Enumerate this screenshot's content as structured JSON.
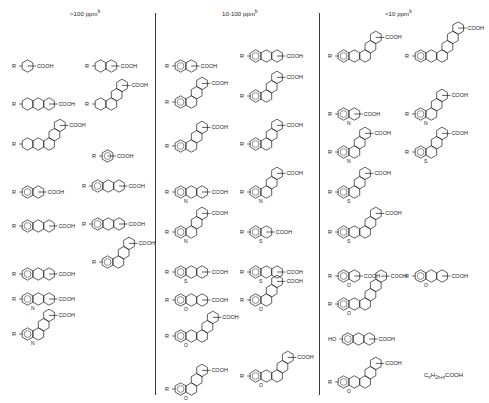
{
  "figure": {
    "columns": [
      {
        "id": "gt100",
        "header": ">100 ppm",
        "footnote": "b",
        "header_x": 70
      },
      {
        "id": "10to100",
        "header": "10-100 ppm",
        "footnote": "b",
        "header_x": 222
      },
      {
        "id": "lt10",
        "header": "<10 ppm",
        "footnote": "b",
        "header_x": 385
      }
    ],
    "dividers_x": [
      155,
      319
    ],
    "labels": {
      "acid": "COOH",
      "substituent": "R",
      "hydroxy": "HO",
      "nitrogen": "N",
      "sulfur": "S",
      "oxygen": "O",
      "hydrogen": "H"
    },
    "general_formula": {
      "base": "C",
      "n": "n",
      "h": "H",
      "sub": "2n+z",
      "tail": "COOH",
      "x": 424,
      "y": 372
    }
  },
  "structures": [
    {
      "col": 0,
      "x": 12,
      "y": 52,
      "rings": 1,
      "desc": "cyclohexane carboxylic acid"
    },
    {
      "col": 0,
      "x": 85,
      "y": 52,
      "rings": 2,
      "desc": "decalin carboxylic acid"
    },
    {
      "col": 0,
      "x": 12,
      "y": 90,
      "rings": 3,
      "desc": "perhydrophenanthrene carboxylic acid"
    },
    {
      "col": 0,
      "x": 85,
      "y": 90,
      "rings": 4,
      "desc": "steroid-type carboxylic acid"
    },
    {
      "col": 0,
      "x": 12,
      "y": 130,
      "rings": 5,
      "desc": "pentacyclic carboxylic acid"
    },
    {
      "col": 0,
      "x": 92,
      "y": 142,
      "rings": 1,
      "aromatic": true,
      "desc": "benzoic acid"
    },
    {
      "col": 0,
      "x": 12,
      "y": 178,
      "rings": 2,
      "aromatic": true,
      "desc": "tetralin carboxylic acid"
    },
    {
      "col": 0,
      "x": 82,
      "y": 172,
      "rings": 3,
      "aromatic": true,
      "desc": "hexahydrophenanthrene carboxylic acid"
    },
    {
      "col": 0,
      "x": 12,
      "y": 212,
      "rings": 3,
      "aromatic": true,
      "desc": "acenaphthene-type carboxylic acid"
    },
    {
      "col": 0,
      "x": 82,
      "y": 210,
      "rings": 3,
      "aromatic": true,
      "desc": "octahydrophenanthrene carboxylic acid"
    },
    {
      "col": 0,
      "x": 12,
      "y": 260,
      "rings": 3,
      "aromatic": true,
      "desc": "hexahydrofluorene carboxylic acid"
    },
    {
      "col": 0,
      "x": 92,
      "y": 248,
      "rings": 4,
      "aromatic": true,
      "desc": "hexahydropyrene carboxylic acid"
    },
    {
      "col": 0,
      "x": 12,
      "y": 285,
      "rings": 3,
      "aromatic": true,
      "hetero": "N",
      "desc": "carbazole carboxylic acid"
    },
    {
      "col": 0,
      "x": 12,
      "y": 320,
      "rings": 4,
      "aromatic": true,
      "hetero": "N",
      "desc": "benzacridine carboxylic acid"
    },
    {
      "col": 1,
      "x": 165,
      "y": 52,
      "rings": 2,
      "aromatic": true,
      "desc": "naphthoic acid"
    },
    {
      "col": 1,
      "x": 240,
      "y": 42,
      "rings": 3,
      "aromatic": true,
      "desc": "phenanthrene carboxylic acid"
    },
    {
      "col": 1,
      "x": 165,
      "y": 88,
      "rings": 4,
      "aromatic": true,
      "desc": "cyclopenta[a]phenanthrene carboxylic acid"
    },
    {
      "col": 1,
      "x": 240,
      "y": 82,
      "rings": 4,
      "aromatic": true,
      "desc": "pyrene carboxylic acid"
    },
    {
      "col": 1,
      "x": 165,
      "y": 132,
      "rings": 4,
      "aromatic": true,
      "desc": "chrysene carboxylic acid"
    },
    {
      "col": 1,
      "x": 240,
      "y": 130,
      "rings": 4,
      "aromatic": true,
      "desc": "benzofluorene carboxylic acid"
    },
    {
      "col": 1,
      "x": 165,
      "y": 178,
      "rings": 3,
      "aromatic": true,
      "hetero": "N",
      "desc": "acridine carboxylic acid"
    },
    {
      "col": 1,
      "x": 240,
      "y": 178,
      "rings": 4,
      "aromatic": true,
      "hetero": "N",
      "desc": "benzocarbazole carboxylic acid"
    },
    {
      "col": 1,
      "x": 165,
      "y": 218,
      "rings": 4,
      "aromatic": true,
      "hetero": "N",
      "desc": "benzocarbazole carboxylic acid isomer"
    },
    {
      "col": 1,
      "x": 240,
      "y": 218,
      "rings": 2,
      "aromatic": true,
      "hetero": "S",
      "desc": "benzothiophene carboxylic acid"
    },
    {
      "col": 1,
      "x": 165,
      "y": 258,
      "rings": 3,
      "aromatic": true,
      "hetero": "S",
      "desc": "dibenzothiophene carboxylic acid"
    },
    {
      "col": 1,
      "x": 240,
      "y": 258,
      "rings": 3,
      "aromatic": true,
      "hetero": "S",
      "desc": "dibenzothiophene carboxylic acid isomer"
    },
    {
      "col": 1,
      "x": 165,
      "y": 286,
      "rings": 3,
      "aromatic": true,
      "hetero": "O",
      "desc": "dibenzofuran carboxylic acid"
    },
    {
      "col": 1,
      "x": 240,
      "y": 286,
      "rings": 4,
      "aromatic": true,
      "hetero": "O",
      "desc": "benzonaphthofuran carboxylic acid"
    },
    {
      "col": 1,
      "x": 165,
      "y": 322,
      "rings": 5,
      "aromatic": true,
      "hetero": "O",
      "desc": "dinaphthofuran carboxylic acid"
    },
    {
      "col": 1,
      "x": 165,
      "y": 375,
      "rings": 4,
      "aromatic": true,
      "hetero": "O",
      "desc": "benzonaphthofuran carboxylic acid isomer"
    },
    {
      "col": 1,
      "x": 240,
      "y": 362,
      "rings": 5,
      "aromatic": true,
      "hetero": "O",
      "desc": "fluorenone-fused carboxylic acid"
    },
    {
      "col": 2,
      "x": 328,
      "y": 42,
      "rings": 5,
      "aromatic": true,
      "desc": "picene carboxylic acid"
    },
    {
      "col": 2,
      "x": 405,
      "y": 42,
      "rings": 6,
      "aromatic": true,
      "desc": "benzopyrene-type carboxylic acid"
    },
    {
      "col": 2,
      "x": 328,
      "y": 100,
      "rings": 2,
      "aromatic": true,
      "hetero": "N",
      "desc": "quinoline carboxylic acid"
    },
    {
      "col": 2,
      "x": 405,
      "y": 100,
      "rings": 4,
      "aromatic": true,
      "hetero": "N",
      "desc": "benzacridine carboxylic acid"
    },
    {
      "col": 2,
      "x": 328,
      "y": 138,
      "rings": 4,
      "aromatic": true,
      "hetero": "N",
      "desc": "dihydrophenazine carboxylic acid"
    },
    {
      "col": 2,
      "x": 405,
      "y": 138,
      "rings": 4,
      "aromatic": true,
      "hetero": "S",
      "desc": "benzonaphthothiophene carboxylic acid"
    },
    {
      "col": 2,
      "x": 328,
      "y": 178,
      "rings": 4,
      "aromatic": true,
      "hetero": "S",
      "desc": "naphthobenzothiophene carboxylic acid"
    },
    {
      "col": 2,
      "x": 328,
      "y": 218,
      "rings": 5,
      "aromatic": true,
      "hetero": "S",
      "desc": "dinaphthothiophene carboxylic acid"
    },
    {
      "col": 2,
      "x": 328,
      "y": 262,
      "rings": 2,
      "aromatic": true,
      "hetero": "O",
      "desc": "benzofuran carboxylic acid"
    },
    {
      "col": 2,
      "x": 405,
      "y": 262,
      "rings": 3,
      "aromatic": true,
      "hetero": "O",
      "desc": "dibenzofuran carboxylic acid"
    },
    {
      "col": 2,
      "x": 328,
      "y": 290,
      "rings": 6,
      "aromatic": true,
      "hetero": "O",
      "desc": "extended furan-fused carboxylic acid"
    },
    {
      "col": 2,
      "x": 328,
      "y": 325,
      "rings": 3,
      "aromatic": true,
      "substituent": "HO",
      "desc": "hydroxy-octahydrophenanthrene carboxylic acid"
    },
    {
      "col": 2,
      "x": 328,
      "y": 368,
      "rings": 5,
      "aromatic": true,
      "hetero": "O",
      "desc": "dioxin-bridged carboxylic acid"
    }
  ]
}
